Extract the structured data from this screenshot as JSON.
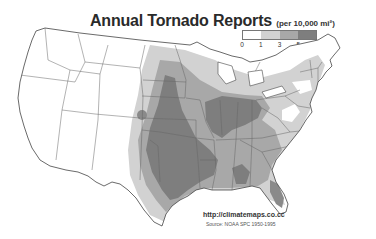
{
  "title": {
    "main": "Annual Tornado Reports",
    "unit": "(per 10,000 mi²)"
  },
  "legend": {
    "ticks": [
      "0",
      "1",
      "3",
      "5",
      "10"
    ],
    "classes": [
      {
        "range": "0-1",
        "color": "#ffffff"
      },
      {
        "range": "1-3",
        "color": "#d2d2d2"
      },
      {
        "range": "3-5",
        "color": "#a8a8a8"
      },
      {
        "range": "5-10",
        "color": "#7e7e7e"
      }
    ]
  },
  "map": {
    "region": "Contiguous United States",
    "background": "#ffffff",
    "state_border_color": "#555555"
  },
  "credits": {
    "url": "http://climatemaps.co.cc",
    "source": "Source: NOAA SPC 1950-1995"
  }
}
